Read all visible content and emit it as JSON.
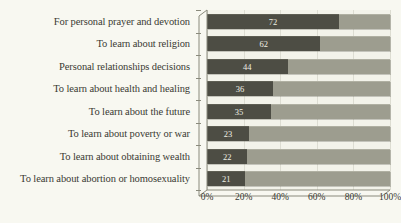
{
  "chart_data": {
    "type": "bar",
    "orientation": "horizontal",
    "stacked": true,
    "title": "",
    "subtitle": "",
    "xlabel": "",
    "ylabel": "",
    "xlim": [
      0,
      100
    ],
    "xtick_labels": [
      "0%",
      "20%",
      "40%",
      "60%",
      "80%",
      "100%"
    ],
    "xtick_values": [
      0,
      20,
      40,
      60,
      80,
      100
    ],
    "grid": true,
    "legend": "none",
    "categories": [
      "For personal prayer and devotion",
      "To learn about religion",
      "Personal relationships decisions",
      "To learn about health and healing",
      "To learn about the future",
      "To learn about poverty or war",
      "To learn about obtaining wealth",
      "To learn about abortion or homosexuality"
    ],
    "series": [
      {
        "name": "Yes",
        "color": "#4d4d44",
        "values": [
          72,
          62,
          44,
          36,
          35,
          23,
          22,
          21
        ],
        "data_labels": [
          "72",
          "62",
          "44",
          "36",
          "35",
          "23",
          "22",
          "21"
        ]
      },
      {
        "name": "Remainder",
        "color": "#9d9d8f",
        "values": [
          28,
          38,
          56,
          64,
          65,
          77,
          78,
          79
        ],
        "data_labels": [
          "",
          "",
          "",
          "",
          "",
          "",
          "",
          ""
        ]
      }
    ]
  },
  "colors": {
    "background": "#f8f8f1",
    "plot_background": "#f3f3ea",
    "bar_dark": "#4d4d44",
    "bar_light": "#9d9d8f",
    "gridline": "#ddddd2",
    "axis": "#8a8a7c",
    "text": "#3a3a33",
    "value_text": "#efefe4"
  }
}
